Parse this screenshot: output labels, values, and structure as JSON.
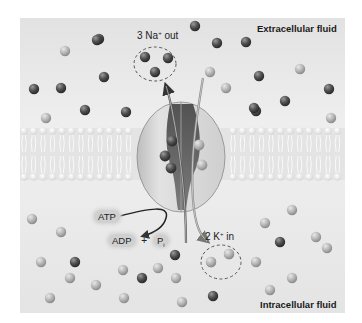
{
  "figure": {
    "regions": {
      "top_label": "Extracellular fluid",
      "bottom_label": "Intracellular fluid"
    },
    "annotations": {
      "na_out": {
        "count": "3",
        "ion": "Na",
        "charge": "+",
        "direction": "out"
      },
      "k_in": {
        "count": "2",
        "ion": "K",
        "charge": "+",
        "direction": "in"
      },
      "atp": "ATP",
      "adp": "ADP",
      "plus": "+",
      "pi": "P",
      "pi_sub": "i"
    },
    "legend_colors": {
      "sodium_ion": "#5a5a5a",
      "potassium_ion": "#b5b5b5",
      "membrane": "#f4f4f4",
      "pump_protein": "#dcdcdc"
    },
    "ions": {
      "extracellular_na": [
        [
          99,
          39
        ],
        [
          195,
          26
        ],
        [
          97,
          40
        ],
        [
          217,
          43
        ],
        [
          246,
          42
        ],
        [
          61,
          88
        ],
        [
          34,
          89
        ],
        [
          104,
          77
        ],
        [
          85,
          110
        ],
        [
          126,
          112
        ],
        [
          259,
          76
        ],
        [
          256,
          111
        ],
        [
          285,
          101
        ],
        [
          329,
          89
        ],
        [
          254,
          108
        ]
      ],
      "extracellular_k": [
        [
          65,
          51
        ],
        [
          210,
          72
        ],
        [
          226,
          88
        ],
        [
          300,
          69
        ],
        [
          331,
          118
        ],
        [
          46,
          118
        ]
      ],
      "na_out_group": [
        [
          145,
          57
        ],
        [
          168,
          58
        ],
        [
          155,
          72
        ]
      ],
      "bound_na": [
        [
          172,
          141
        ],
        [
          165,
          156
        ],
        [
          171,
          168
        ]
      ],
      "bound_k": [
        [
          199,
          145
        ],
        [
          202,
          165
        ]
      ],
      "intracellular_na": [
        [
          75,
          262
        ],
        [
          142,
          278
        ],
        [
          175,
          255
        ],
        [
          280,
          242
        ],
        [
          213,
          296
        ]
      ],
      "intracellular_k": [
        [
          32,
          219
        ],
        [
          61,
          232
        ],
        [
          41,
          262
        ],
        [
          70,
          278
        ],
        [
          96,
          285
        ],
        [
          123,
          270
        ],
        [
          158,
          268
        ],
        [
          176,
          278
        ],
        [
          50,
          298
        ],
        [
          124,
          298
        ],
        [
          182,
          302
        ],
        [
          211,
          262
        ],
        [
          229,
          254
        ],
        [
          265,
          223
        ],
        [
          292,
          210
        ],
        [
          256,
          262
        ],
        [
          316,
          237
        ],
        [
          292,
          278
        ],
        [
          327,
          248
        ],
        [
          270,
          290
        ]
      ]
    }
  }
}
